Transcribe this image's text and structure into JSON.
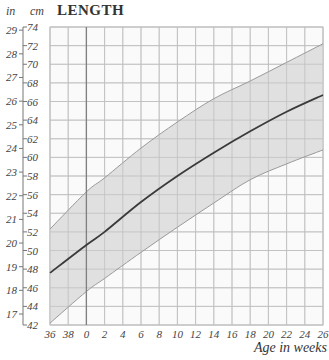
{
  "chart_data": {
    "type": "area",
    "title": "LENGTH",
    "xlabel": "Age in weeks",
    "ylabel_left_units": "in",
    "ylabel_right_units": "cm",
    "x_tick_labels": [
      "36",
      "38",
      "0",
      "2",
      "4",
      "6",
      "8",
      "10",
      "12",
      "14",
      "16",
      "18",
      "20",
      "22",
      "24",
      "26"
    ],
    "x_values_weeks_from_birth": [
      -4,
      -2,
      0,
      2,
      4,
      6,
      8,
      10,
      12,
      14,
      16,
      18,
      20,
      22,
      24,
      26
    ],
    "cm_ticks": [
      42,
      44,
      46,
      48,
      50,
      52,
      54,
      56,
      58,
      60,
      62,
      64,
      66,
      68,
      70,
      72,
      74
    ],
    "in_ticks": [
      17,
      18,
      19,
      20,
      21,
      22,
      23,
      24,
      25,
      26,
      27,
      28,
      29
    ],
    "ylim_cm": [
      42,
      74
    ],
    "xlim_weeks": [
      -4,
      26
    ],
    "grid": true,
    "birth_line_week": 0,
    "series": [
      {
        "name": "upper band",
        "x": [
          -4,
          0,
          2,
          6,
          10,
          14,
          18,
          22,
          26
        ],
        "values": [
          52.3,
          56.3,
          57.8,
          61.0,
          63.8,
          66.3,
          68.2,
          70.2,
          72.2
        ]
      },
      {
        "name": "median",
        "x": [
          -4,
          0,
          2,
          6,
          10,
          14,
          18,
          22,
          26
        ],
        "values": [
          47.6,
          50.6,
          52.0,
          55.2,
          58.0,
          60.5,
          62.8,
          64.9,
          66.7
        ]
      },
      {
        "name": "lower band",
        "x": [
          -4,
          0,
          2,
          6,
          10,
          14,
          18,
          22,
          26
        ],
        "values": [
          42.2,
          45.6,
          47.0,
          49.8,
          52.5,
          55.1,
          57.6,
          59.3,
          60.8
        ]
      }
    ]
  },
  "labels": {
    "title": "LENGTH",
    "unit_in": "in",
    "unit_cm": "cm",
    "xlabel": "Age in weeks"
  },
  "colors": {
    "band_fill": "#d9d9d9",
    "band_edge": "#9a9a9a",
    "median": "#3a3a3a",
    "grid": "#c8c8c8",
    "birth_line": "#808080"
  }
}
